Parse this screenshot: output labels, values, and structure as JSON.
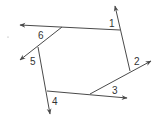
{
  "diagram": {
    "stroke_color": "#4a4a4a",
    "labels": [
      {
        "id": "1",
        "text": "1",
        "x": 109,
        "y": 27
      },
      {
        "id": "2",
        "text": "2",
        "x": 134,
        "y": 65
      },
      {
        "id": "3",
        "text": "3",
        "x": 112,
        "y": 94
      },
      {
        "id": "4",
        "text": "4",
        "x": 52,
        "y": 105
      },
      {
        "id": "5",
        "text": "5",
        "x": 30,
        "y": 65
      },
      {
        "id": "6",
        "text": "6",
        "x": 38,
        "y": 39
      }
    ],
    "vertices": [
      {
        "name": "top-left",
        "x": 62,
        "y": 27
      },
      {
        "name": "top-right",
        "x": 120,
        "y": 30
      },
      {
        "name": "right",
        "x": 130,
        "y": 71
      },
      {
        "name": "bottom-right",
        "x": 90,
        "y": 94
      },
      {
        "name": "bottom-left",
        "x": 47,
        "y": 91
      },
      {
        "name": "left",
        "x": 38,
        "y": 47
      }
    ]
  }
}
